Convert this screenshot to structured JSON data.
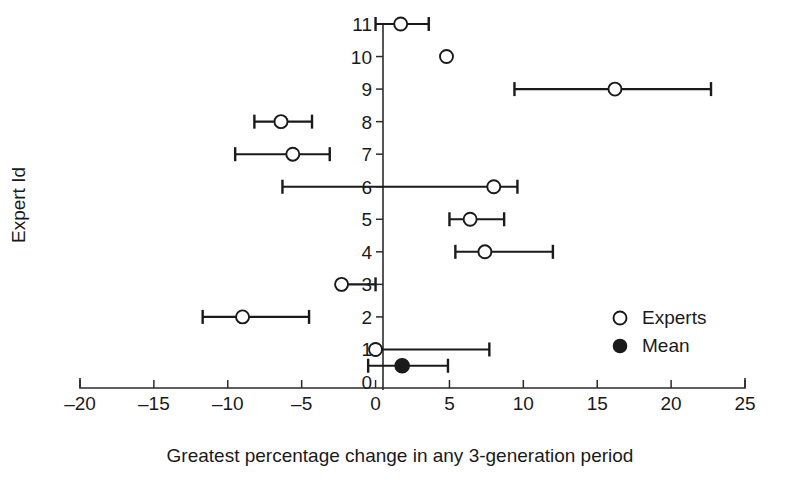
{
  "chart_data": {
    "type": "scatter",
    "title": "",
    "xlabel": "Greatest percentage change in any 3-generation period",
    "ylabel": "Expert Id",
    "xlim": [
      -20,
      25
    ],
    "ylim": [
      0,
      11
    ],
    "xticks": [
      -20,
      -15,
      -10,
      -5,
      0,
      5,
      10,
      15,
      20,
      25
    ],
    "xticklabels": [
      "–20",
      "–15",
      "–10",
      "–5",
      "0",
      "5",
      "10",
      "15",
      "20",
      "25"
    ],
    "yticks": [
      0,
      1,
      2,
      3,
      4,
      5,
      6,
      7,
      8,
      9,
      10,
      11
    ],
    "yticklabels": [
      "0",
      "1",
      "2",
      "3",
      "4",
      "5",
      "6",
      "7",
      "8",
      "9",
      "10",
      "11"
    ],
    "grid": false,
    "legend_position": "center-right",
    "legend": [
      {
        "name": "Experts",
        "marker": "open-circle"
      },
      {
        "name": "Mean",
        "marker": "filled-circle"
      }
    ],
    "series": [
      {
        "name": "Experts",
        "marker": "open-circle",
        "points": [
          {
            "expert_id": 11,
            "value": 1.7,
            "low": 0.0,
            "high": 3.6
          },
          {
            "expert_id": 10,
            "value": 4.8,
            "low": null,
            "high": null
          },
          {
            "expert_id": 9,
            "value": 16.2,
            "low": 9.4,
            "high": 22.7
          },
          {
            "expert_id": 8,
            "value": -6.4,
            "low": -8.2,
            "high": -4.3
          },
          {
            "expert_id": 7,
            "value": -5.6,
            "low": -9.5,
            "high": -3.1
          },
          {
            "expert_id": 6,
            "value": 8.0,
            "low": -6.3,
            "high": 9.6
          },
          {
            "expert_id": 5,
            "value": 6.4,
            "low": 5.0,
            "high": 8.7
          },
          {
            "expert_id": 4,
            "value": 7.4,
            "low": 5.4,
            "high": 12.0
          },
          {
            "expert_id": 3,
            "value": -2.3,
            "low": -2.3,
            "high": 0.0
          },
          {
            "expert_id": 2,
            "value": -9.0,
            "low": -11.7,
            "high": -4.5
          },
          {
            "expert_id": 1,
            "value": 0.0,
            "low": 0.0,
            "high": 7.7
          }
        ]
      },
      {
        "name": "Mean",
        "marker": "filled-circle",
        "points": [
          {
            "expert_id": 0.5,
            "value": 1.8,
            "low": -0.5,
            "high": 4.9
          }
        ]
      }
    ]
  }
}
